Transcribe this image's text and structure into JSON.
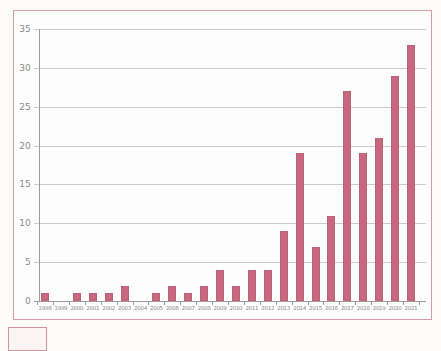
{
  "page": {
    "background_color": "#fcfbfa"
  },
  "chart": {
    "frame_border_color": "#d69ba5",
    "plot_background": "#fdfdfd"
  },
  "chart_data": {
    "type": "bar",
    "categories": [
      "1998",
      "1999",
      "2000",
      "2001",
      "2002",
      "2003",
      "2004",
      "2005",
      "2006",
      "2007",
      "2008",
      "2009",
      "2010",
      "2011",
      "2012",
      "2013",
      "2014",
      "2015",
      "2016",
      "2017",
      "2018",
      "2019",
      "2020",
      "2021"
    ],
    "values": [
      1,
      0,
      1,
      1,
      1,
      2,
      0,
      1,
      2,
      1,
      2,
      4,
      2,
      4,
      4,
      9,
      19,
      7,
      11,
      27,
      19,
      21,
      29,
      33
    ],
    "title": "",
    "xlabel": "",
    "ylabel": "",
    "ylim": [
      0,
      35
    ],
    "yticks": [
      0,
      5,
      10,
      15,
      20,
      25,
      30,
      35
    ],
    "grid": true,
    "legend_position": "none",
    "bar_color": "#c6697e",
    "gridline_color": "#cacaca",
    "axis_color": "#9b9b9b",
    "tick_label_color": "#8a8a8a"
  }
}
